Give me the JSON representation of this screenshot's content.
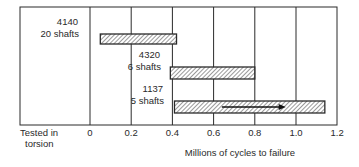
{
  "chart_data": {
    "type": "bar",
    "orientation": "horizontal",
    "title": "",
    "xlabel": "Millions of cycles to failure",
    "ylabel": "",
    "corner_label": [
      "Tested in",
      "torsion"
    ],
    "xlim": [
      0,
      1.2
    ],
    "xticks": [
      "0",
      "0.2",
      "0.4",
      "0.6",
      "0.8",
      "1.0",
      "1.2"
    ],
    "grid": true,
    "legend": null,
    "series": [
      {
        "name": "4140",
        "sublabel": "20 shafts",
        "start": 0.05,
        "end": 0.42,
        "arrow": false
      },
      {
        "name": "4320",
        "sublabel": "6 shafts",
        "start": 0.39,
        "end": 0.8,
        "arrow": false
      },
      {
        "name": "1137",
        "sublabel": "5 shafts",
        "start": 0.41,
        "end": 1.14,
        "arrow": true,
        "arrow_from": 0.64,
        "arrow_to": 0.95
      }
    ]
  },
  "colors": {
    "line": "#2a2a2a",
    "hatch": "#555555",
    "background": "#ffffff"
  }
}
